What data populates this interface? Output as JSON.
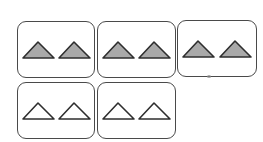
{
  "diagram": {
    "type": "grouped-shapes",
    "description": "Five rounded boxes, each containing two triangles",
    "colors": {
      "box_border": "#4a4a4a",
      "triangle_stroke": "#2e2e2e",
      "filled_triangle": "#a9a9a9",
      "empty_triangle": "#ffffff",
      "background": "#ffffff"
    },
    "groups": [
      {
        "id": "group-1",
        "row": 1,
        "col": 1,
        "shape": "triangle",
        "count": 2,
        "filled": true
      },
      {
        "id": "group-2",
        "row": 1,
        "col": 2,
        "shape": "triangle",
        "count": 2,
        "filled": true
      },
      {
        "id": "group-3",
        "row": 1,
        "col": 3,
        "shape": "triangle",
        "count": 2,
        "filled": true
      },
      {
        "id": "group-4",
        "row": 2,
        "col": 1,
        "shape": "triangle",
        "count": 2,
        "filled": false
      },
      {
        "id": "group-5",
        "row": 2,
        "col": 2,
        "shape": "triangle",
        "count": 2,
        "filled": false
      }
    ],
    "summary": {
      "total_groups": 5,
      "triangles_per_group": 2,
      "filled_groups": 3,
      "empty_groups": 2,
      "total_triangles": 10,
      "filled_triangles": 6,
      "empty_triangles": 4
    }
  }
}
